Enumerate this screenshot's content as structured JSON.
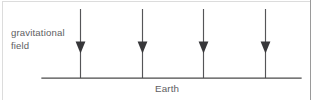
{
  "figure": {
    "type": "physics-diagram",
    "title_visible": false,
    "background_color": "#ffffff",
    "width": 320,
    "height": 100,
    "labels": {
      "field_label_line1": "gravitational",
      "field_label_line2": "field",
      "ground_label": "Earth"
    },
    "colors": {
      "arrow": "#555558",
      "arrow_head": "#37373a",
      "ground": "#4a4a4a",
      "text": "#5e5e62",
      "frame": "#dcdcdc",
      "frame_right": "#9a9a9a"
    },
    "ground_line": {
      "x1": 42,
      "x2": 301,
      "y": 78
    },
    "field_arrows": [
      {
        "x": 80,
        "y_top": 9,
        "y_head": 48,
        "y_bottom": 78
      },
      {
        "x": 142,
        "y_top": 9,
        "y_head": 48,
        "y_bottom": 78
      },
      {
        "x": 203,
        "y_top": 9,
        "y_head": 48,
        "y_bottom": 78
      },
      {
        "x": 265,
        "y_top": 9,
        "y_head": 48,
        "y_bottom": 78
      }
    ],
    "frame": {
      "top_y": 1,
      "left_x": 2,
      "right_x": 310
    }
  }
}
